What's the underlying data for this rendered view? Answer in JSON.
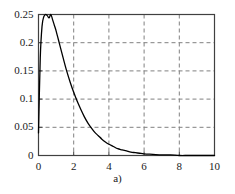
{
  "caption": "a)",
  "chart_data": {
    "type": "line",
    "title": "",
    "subtitle": "",
    "xlabel": "",
    "ylabel": "",
    "xlim": [
      0,
      10
    ],
    "ylim": [
      0,
      0.25
    ],
    "grid": true,
    "legend": null,
    "x_ticks": [
      "0",
      "2",
      "4",
      "6",
      "8",
      "10"
    ],
    "x_tick_values": [
      0,
      2,
      4,
      6,
      8,
      10
    ],
    "y_ticks": [
      "0",
      "0.05",
      "0.1",
      "0.15",
      "0.2",
      "0.25"
    ],
    "y_tick_values": [
      0,
      0.05,
      0.1,
      0.15,
      0.2,
      0.25
    ],
    "gridline_color": "#808080",
    "curve_color": "#000000",
    "frame_color": "#404040",
    "series": [
      {
        "name": "density",
        "x": [
          0.0,
          0.1,
          0.2,
          0.3,
          0.4,
          0.5,
          0.6,
          0.7,
          0.8,
          0.9,
          1.0,
          1.2,
          1.4,
          1.6,
          1.8,
          2.0,
          2.2,
          2.4,
          2.6,
          2.8,
          3.0,
          3.2,
          3.4,
          3.6,
          3.8,
          4.0,
          4.25,
          4.5,
          4.75,
          5.0,
          5.25,
          5.5,
          5.75,
          6.0,
          6.5,
          7.0,
          7.5,
          8.0,
          8.5,
          9.0,
          9.5,
          10.0
        ],
        "y": [
          0.04,
          0.173,
          0.229,
          0.246,
          0.25,
          0.248,
          0.244,
          0.25,
          0.241,
          0.231,
          0.221,
          0.197,
          0.173,
          0.15,
          0.13,
          0.112,
          0.096,
          0.082,
          0.069,
          0.058,
          0.049,
          0.041,
          0.035,
          0.029,
          0.024,
          0.02,
          0.016,
          0.012,
          0.01,
          0.008,
          0.006,
          0.005,
          0.004,
          0.003,
          0.002,
          0.001,
          0.001,
          0.0,
          0.0,
          0.0,
          0.0,
          0.0
        ]
      }
    ]
  }
}
